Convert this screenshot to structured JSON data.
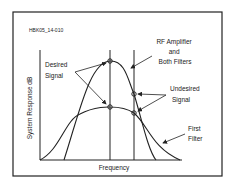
{
  "figure": {
    "id_label": "HBK05_14-010",
    "y_axis_label": "System Response dB",
    "x_axis_label": "Frequency",
    "labels": {
      "desired_line1": "Desired",
      "desired_line2": "Signal",
      "rf_line1": "RF Amplifier",
      "rf_line2": "and",
      "rf_line3": "Both Filters",
      "undesired_line1": "Undesired",
      "undesired_line2": "Signal",
      "first_line1": "First",
      "first_line2": "Filter"
    },
    "colors": {
      "line": "#222222",
      "background": "#ffffff"
    }
  }
}
